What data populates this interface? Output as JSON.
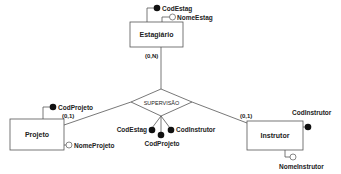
{
  "diagram": {
    "type": "entity-relationship",
    "entities": [
      {
        "name": "Estagiário",
        "attributes": [
          {
            "name": "CodEstag",
            "key": true
          },
          {
            "name": "NomeEstag",
            "key": false
          }
        ]
      },
      {
        "name": "Projeto",
        "attributes": [
          {
            "name": "CodProjeto",
            "key": true
          },
          {
            "name": "NomeProjeto",
            "key": false
          }
        ]
      },
      {
        "name": "Instrutor",
        "attributes": [
          {
            "name": "CodInstrutor",
            "key": true
          },
          {
            "name": "NomeInstrutor",
            "key": false
          }
        ]
      }
    ],
    "relationship": {
      "name": "SUPERVISÃO",
      "attributes": [
        {
          "name": "CodEstag",
          "key": true
        },
        {
          "name": "CodProjeto",
          "key": true
        },
        {
          "name": "CodInstrutor",
          "key": true
        }
      ]
    },
    "cardinalities": {
      "estagiario": "(0,N)",
      "projeto": "(0,1)",
      "instrutor": "(0,1)"
    }
  }
}
